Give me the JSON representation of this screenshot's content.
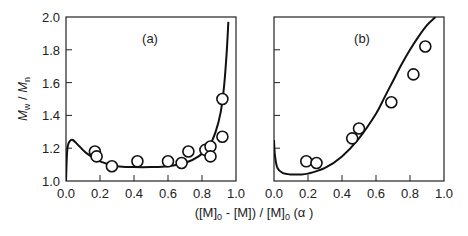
{
  "chart_data": [
    {
      "type": "scatter",
      "panel_label": "(a)",
      "xlabel": "([M]0 - [M]) / [M]0 (α)",
      "ylabel": "Mw / Mn",
      "xlim": [
        0.0,
        1.0
      ],
      "ylim": [
        1.0,
        2.0
      ],
      "x_ticks": [
        "0.0",
        "0.2",
        "0.4",
        "0.6",
        "0.8",
        "1.0"
      ],
      "y_ticks": [
        "1.0",
        "1.2",
        "1.4",
        "1.6",
        "1.8",
        "2.0"
      ],
      "grid": false,
      "series": [
        {
          "name": "experimental",
          "marker": "open-circle",
          "x": [
            0.17,
            0.18,
            0.27,
            0.42,
            0.6,
            0.68,
            0.72,
            0.82,
            0.85,
            0.85,
            0.92,
            0.92
          ],
          "y": [
            1.18,
            1.15,
            1.09,
            1.12,
            1.12,
            1.11,
            1.18,
            1.19,
            1.21,
            1.15,
            1.5,
            1.27
          ]
        },
        {
          "name": "simulation",
          "marker": "line",
          "x": [
            0.0,
            0.005,
            0.01,
            0.02,
            0.04,
            0.08,
            0.12,
            0.2,
            0.3,
            0.4,
            0.5,
            0.6,
            0.7,
            0.78,
            0.84,
            0.88,
            0.91,
            0.93,
            0.945,
            0.955
          ],
          "y": [
            1.0,
            1.15,
            1.21,
            1.24,
            1.25,
            1.21,
            1.17,
            1.12,
            1.09,
            1.085,
            1.085,
            1.09,
            1.11,
            1.15,
            1.21,
            1.3,
            1.42,
            1.58,
            1.78,
            1.97
          ]
        }
      ]
    },
    {
      "type": "scatter",
      "panel_label": "(b)",
      "xlabel": "([M]0 - [M]) / [M]0 (α)",
      "ylabel": "Mw / Mn",
      "xlim": [
        0.0,
        1.0
      ],
      "ylim": [
        1.0,
        2.0
      ],
      "x_ticks": [
        "0.0",
        "0.2",
        "0.4",
        "0.6",
        "0.8",
        "1.0"
      ],
      "y_ticks": [],
      "grid": false,
      "series": [
        {
          "name": "experimental",
          "marker": "open-circle",
          "x": [
            0.19,
            0.25,
            0.46,
            0.5,
            0.69,
            0.82,
            0.89
          ],
          "y": [
            1.12,
            1.11,
            1.26,
            1.32,
            1.48,
            1.65,
            1.82
          ]
        },
        {
          "name": "simulation",
          "marker": "line",
          "x": [
            0.0,
            0.005,
            0.02,
            0.05,
            0.1,
            0.15,
            0.2,
            0.3,
            0.4,
            0.5,
            0.6,
            0.65,
            0.7,
            0.75,
            0.8,
            0.85,
            0.9,
            0.95
          ],
          "y": [
            1.25,
            1.16,
            1.08,
            1.05,
            1.04,
            1.04,
            1.045,
            1.08,
            1.15,
            1.26,
            1.41,
            1.51,
            1.61,
            1.71,
            1.8,
            1.88,
            1.95,
            2.0
          ]
        }
      ]
    }
  ],
  "figure": {
    "panel_a_label": "(a)",
    "panel_b_label": "(b)",
    "y_axis_title_main": "M",
    "y_axis_title_sub1": "w",
    "y_axis_title_sep": " / ",
    "y_axis_title_sub2": "n",
    "x_axis_title_parts": [
      "([M]",
      "0",
      " - [M]) / [M]",
      "0",
      "  (α )"
    ]
  }
}
